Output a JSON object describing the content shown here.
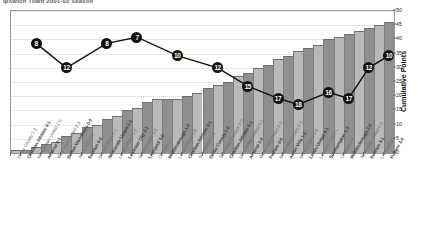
{
  "title": "Ipswich Town 2001-02 season",
  "axis": {
    "right_title": "Cumulative Points",
    "right_ticks": [
      0,
      5,
      10,
      15,
      20,
      25,
      30,
      35,
      40,
      45,
      50
    ],
    "right_min": 0,
    "right_max": 50
  },
  "chart_data": {
    "type": "bar",
    "title": "Ipswich Town 2001-02 season",
    "xlabel": "",
    "ylabel": "Cumulative Points",
    "ylim": [
      0,
      50
    ],
    "grid": true,
    "legend": "none",
    "categories": [
      "Derby County 1-2",
      "Charlton Athletic 0-1",
      "Manchester United 1-0",
      "Arsenal 0-1",
      "West Ham United 2-3",
      "Bolton Wanderers 0-0",
      "Aston Villa 0-0",
      "Everton 0-0",
      "Ipswich Town 0-1",
      "Newcastle United 0-1",
      "Leeds United 1-2",
      "Leicester City 2-1",
      "Southampton 3-3",
      "Liverpool 0-0",
      "Chelsea 2-1",
      "Middlesbrough 1-0",
      "Leeds United 0-0",
      "Charlton Athletic 0-1",
      "Sunderland 1-2",
      "Derby County 1-0",
      "Tottenham Hotspur 0-0",
      "Charlton Athletic 0-1",
      "Manchester United 0-1",
      "Arsenal 1-2",
      "West Ham United 2-3",
      "Fulham 0-0",
      "Bolton Wanderers 0-2",
      "Aston Villa 1-1",
      "Ipswich Town 2-0",
      "Leeds United 0-1",
      "Leicester City 2-1",
      "Southampton 1-3",
      "Chelsea 1-2",
      "Middlesbrough 2-0",
      "Newcastle United 0-0",
      "Everton 3-1",
      "Liverpool 2-1",
      "Fulham 3-0"
    ],
    "series": [
      {
        "name": "Cumulative Points",
        "type": "bar",
        "values": [
          1,
          1,
          2,
          3,
          4,
          6,
          7,
          9,
          10,
          12,
          13,
          15,
          16,
          18,
          19,
          19,
          19,
          20,
          21,
          23,
          24,
          25,
          27,
          28,
          30,
          31,
          33,
          34,
          36,
          37,
          38,
          40,
          41,
          42,
          43,
          44,
          45,
          46
        ]
      },
      {
        "name": "League Position",
        "type": "line",
        "axis": "hidden-left",
        "point_labels": [
          8,
          12,
          8,
          7,
          10,
          12,
          15,
          17,
          18,
          16,
          17,
          12,
          10
        ],
        "point_indices": [
          2,
          5,
          9,
          12,
          16,
          20,
          23,
          26,
          28,
          31,
          33,
          35,
          37
        ]
      }
    ]
  }
}
